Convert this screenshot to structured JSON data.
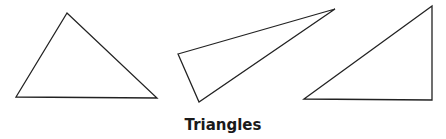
{
  "caption": "Triangles",
  "style": {
    "stroke": "#222222",
    "fill": "none",
    "stroke_width": 1.3
  },
  "triangles": [
    {
      "name": "acute-triangle",
      "points": "67,13 16,97 157,98"
    },
    {
      "name": "obtuse-triangle",
      "points": "178,54 335,9 199,102"
    },
    {
      "name": "right-triangle",
      "points": "304,99 432,6 432,100"
    }
  ]
}
